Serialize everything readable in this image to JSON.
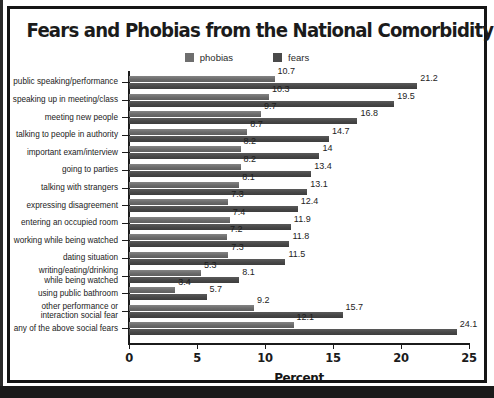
{
  "chart_data": {
    "type": "bar",
    "orientation": "horizontal",
    "title": "Fears and Phobias from the National Comorbidity Survey",
    "xlabel": "Percent",
    "ylabel": "",
    "xlim": [
      0,
      25
    ],
    "xticks": [
      0,
      5,
      10,
      15,
      20,
      25
    ],
    "grid": false,
    "legend_position": "top-center",
    "categories": [
      "public speaking/performance",
      "speaking up in meeting/class",
      "meeting new people",
      "talking to people in authority",
      "important exam/interview",
      "going to parties",
      "talking with strangers",
      "expressing disagreement",
      "entering an occupied room",
      "working while being watched",
      "dating situation",
      "writing/eating/drinking while being watched",
      "using public bathroom",
      "other performance or interaction social fear",
      "any of the above social fears"
    ],
    "series": [
      {
        "name": "phobias",
        "color": "#6e6e6e",
        "values": [
          10.7,
          10.3,
          9.7,
          8.7,
          8.2,
          8.2,
          8.1,
          7.3,
          7.4,
          7.2,
          7.3,
          5.3,
          3.4,
          9.2,
          12.1
        ]
      },
      {
        "name": "fears",
        "color": "#4a4a4a",
        "values": [
          21.2,
          19.5,
          16.8,
          14.7,
          14,
          13.4,
          13.1,
          12.4,
          11.9,
          11.8,
          11.5,
          8.1,
          5.7,
          15.7,
          24.1
        ]
      }
    ]
  },
  "legend": {
    "items": [
      {
        "label": "phobias",
        "color": "#6e6e6e"
      },
      {
        "label": "fears",
        "color": "#4a4a4a"
      }
    ]
  },
  "axis": {
    "x_tick_labels": [
      "0",
      "5",
      "10",
      "15",
      "20",
      "25"
    ],
    "x_axis_title": "Percent"
  },
  "category_label_lines": [
    [
      "public speaking/performance"
    ],
    [
      "speaking up in meeting/class"
    ],
    [
      "meeting new people"
    ],
    [
      "talking to people in authority"
    ],
    [
      "important exam/interview"
    ],
    [
      "going to parties"
    ],
    [
      "talking with strangers"
    ],
    [
      "expressing disagreement"
    ],
    [
      "entering an occupied room"
    ],
    [
      "working while being watched"
    ],
    [
      "dating situation"
    ],
    [
      "writing/eating/drinking",
      "while being watched"
    ],
    [
      "using public bathroom"
    ],
    [
      "other performance or",
      "interaction social fear"
    ],
    [
      "any of the above social fears"
    ]
  ]
}
